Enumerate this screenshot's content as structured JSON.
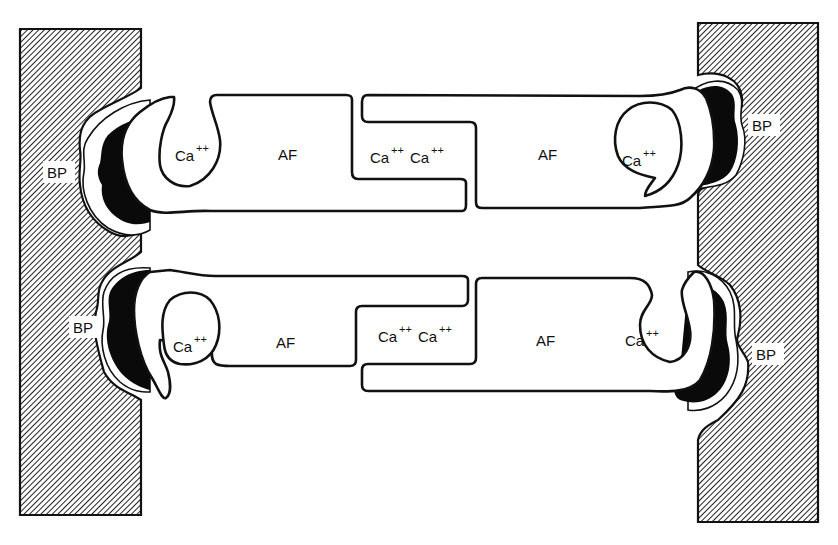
{
  "diagram": {
    "type": "schematic",
    "labels": {
      "bp": "BP",
      "af": "AF",
      "ca": "Ca",
      "ca_charge": "++"
    },
    "top_row": {
      "left_bp": "BP",
      "left_ca": "Ca",
      "left_af": "AF",
      "center_ca_1": "Ca",
      "center_ca_2": "Ca",
      "right_af": "AF",
      "right_ca": "Ca",
      "right_bp": "BP"
    },
    "bottom_row": {
      "left_bp": "BP",
      "left_ca": "Ca",
      "left_af": "AF",
      "center_ca_1": "Ca",
      "center_ca_2": "Ca",
      "right_af": "AF",
      "right_ca": "Ca",
      "right_bp": "BP"
    },
    "charge": "++",
    "colors": {
      "ink": "#111111",
      "background": "#ffffff",
      "hatch": "#111111"
    }
  }
}
